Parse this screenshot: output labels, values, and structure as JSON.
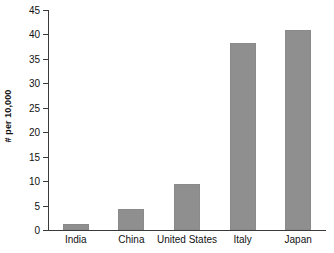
{
  "chart_data": {
    "type": "bar",
    "title": "",
    "subtitle": "",
    "xlabel": "",
    "ylabel": "# per 10,000",
    "categories": [
      "India",
      "China",
      "United States",
      "Italy",
      "Japan"
    ],
    "values": [
      1.2,
      4.2,
      9.5,
      38.2,
      41.0
    ],
    "ylim": [
      0,
      45
    ],
    "ytick_labels": [
      "0",
      "5",
      "10",
      "15",
      "20",
      "25",
      "30",
      "35",
      "40",
      "45"
    ],
    "ytick_values": [
      0,
      5,
      10,
      15,
      20,
      25,
      30,
      35,
      40,
      45
    ],
    "grid": false,
    "legend": null,
    "bar_color": "#8f8f8f",
    "axis_color": "#3a3a3a",
    "background": "#ffffff"
  }
}
